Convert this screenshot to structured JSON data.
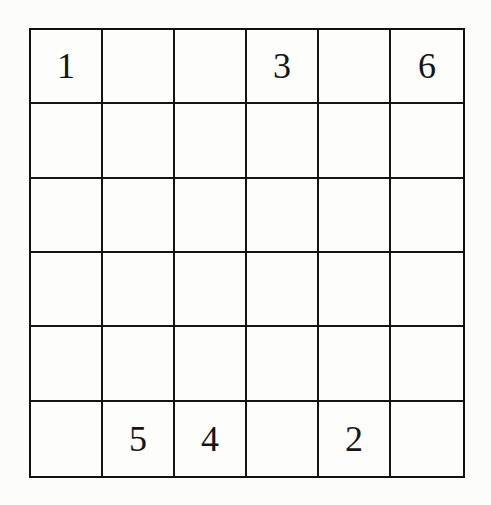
{
  "puzzle": {
    "rows": 6,
    "cols": 6,
    "cells": [
      [
        "1",
        "",
        "",
        "3",
        "",
        "6"
      ],
      [
        "",
        "",
        "",
        "",
        "",
        ""
      ],
      [
        "",
        "",
        "",
        "",
        "",
        ""
      ],
      [
        "",
        "",
        "",
        "",
        "",
        ""
      ],
      [
        "",
        "",
        "",
        "",
        "",
        ""
      ],
      [
        "",
        "5",
        "4",
        "",
        "2",
        ""
      ]
    ]
  }
}
